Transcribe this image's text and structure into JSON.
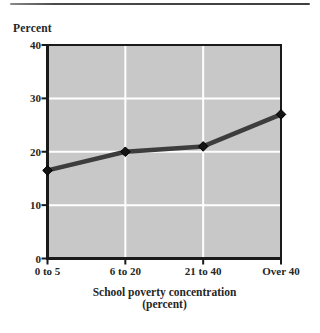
{
  "page": {
    "background": "#ffffff",
    "top_rule_color": "#3f3f3f"
  },
  "chart_data": {
    "type": "line",
    "title": "",
    "ylabel": "Percent",
    "xlabel_line1": "School poverty concentration",
    "xlabel_line2": "(percent)",
    "categories": [
      "0 to 5",
      "6 to 20",
      "21 to 40",
      "Over 40"
    ],
    "values": [
      16.5,
      20,
      21,
      27
    ],
    "yticks": [
      "0",
      "10",
      "20",
      "30",
      "40"
    ],
    "ytick_values": [
      0,
      10,
      20,
      30,
      40
    ],
    "ylim": [
      0,
      40
    ],
    "grid": true,
    "legend": "none",
    "colors": {
      "plot_background": "#c8c8c8",
      "gridline": "#ffffff",
      "axis": "#1a1a1a",
      "line": "#3d3d3d",
      "marker": "#141414",
      "text": "#262626"
    }
  }
}
